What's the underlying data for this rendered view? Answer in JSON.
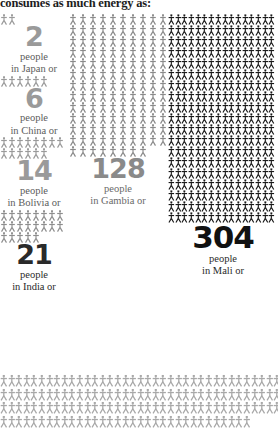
{
  "title": "consumes as much energy as:",
  "chart_data": {
    "type": "pictogram",
    "title": "consumes as much energy as:",
    "unit_label": "people",
    "icon": "person-figure-icon",
    "legend_position": "inline-below-each-group",
    "grid": false,
    "categories": [
      "Japan",
      "China",
      "Bolivia",
      "India",
      "Gambia",
      "Mali"
    ],
    "values": [
      2,
      6,
      14,
      21,
      128,
      304
    ],
    "series": [
      {
        "name": "Japan",
        "value": 2,
        "label": "2",
        "caption_line1": "people",
        "caption_line2": "in Japan or",
        "column": "left",
        "icon_color": "#9a9a9a",
        "number_color": "#9a9a9a"
      },
      {
        "name": "China",
        "value": 6,
        "label": "6",
        "caption_line1": "people",
        "caption_line2": "in China or",
        "column": "left",
        "icon_color": "#9a9a9a",
        "number_color": "#9a9a9a"
      },
      {
        "name": "Bolivia",
        "value": 14,
        "label": "14",
        "caption_line1": "people",
        "caption_line2": "in Bolivia or",
        "column": "left",
        "icon_color": "#9a9a9a",
        "number_color": "#9a9a9a"
      },
      {
        "name": "India",
        "value": 21,
        "label": "21",
        "caption_line1": "people",
        "caption_line2": "in India or",
        "column": "left",
        "icon_color": "#8e8e8e",
        "number_color": "#2a2a2a"
      },
      {
        "name": "Gambia",
        "value": 128,
        "label": "128",
        "caption_line1": "people",
        "caption_line2": "in Gambia or",
        "column": "middle",
        "icon_color": "#8a8a8a",
        "number_color": "#8a8a8a"
      },
      {
        "name": "Mali",
        "value": 304,
        "label": "304",
        "caption_line1": "people",
        "caption_line2": "in Mali or",
        "column": "right",
        "icon_color": "#1a1a1a",
        "number_color": "#111111"
      }
    ],
    "bottom_band": {
      "name": "next-group-partial",
      "icon_color": "#a8a8a8",
      "rows": 4,
      "per_row": 36
    }
  },
  "groups": {
    "japan": {
      "number": "2",
      "line1": "people",
      "line2": "in Japan or",
      "count": 2
    },
    "china": {
      "number": "6",
      "line1": "people",
      "line2": "in China or",
      "count": 6
    },
    "bolivia": {
      "number": "14",
      "line1": "people",
      "line2": "in Bolivia or",
      "count": 14
    },
    "india": {
      "number": "21",
      "line1": "people",
      "line2": "in India or",
      "count": 21
    },
    "gambia": {
      "number": "128",
      "line1": "people",
      "line2": "in Gambia or",
      "count": 128
    },
    "mali": {
      "number": "304",
      "line1": "people",
      "line2": "in Mali or",
      "count": 304
    }
  },
  "colors": {
    "light_gray": "#9a9a9a",
    "mid_gray": "#8a8a8a",
    "dark": "#111111",
    "band_gray": "#a8a8a8",
    "background": "#ffffff"
  }
}
